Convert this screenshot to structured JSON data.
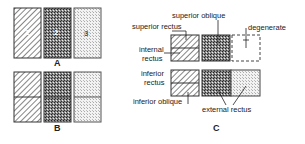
{
  "figure": {
    "panels": [
      {
        "id": "A",
        "label": "A",
        "boxes": [
          {
            "number": "1",
            "pattern": "hatched"
          },
          {
            "number": "2",
            "pattern": "dense-stipple"
          },
          {
            "number": "3",
            "pattern": "light-stipple"
          }
        ]
      },
      {
        "id": "B",
        "label": "B",
        "boxes": [
          {
            "pattern": "hatched",
            "split": "horizontal"
          },
          {
            "pattern": "dense-stipple",
            "split": "horizontal"
          },
          {
            "pattern": "light-stipple",
            "split": "horizontal"
          }
        ]
      },
      {
        "id": "C",
        "label": "C",
        "labels": {
          "superior_oblique": "superior oblique",
          "superior_rectus": "superior rectus",
          "internal_rectus_1": "internal",
          "internal_rectus_2": "rectus",
          "degenerate": "degenerate",
          "inferior_rectus_1": "inferior",
          "inferior_rectus_2": "rectus",
          "inferior_oblique": "inferior oblique",
          "external_rectus": "external rectus"
        }
      }
    ],
    "colors": {
      "stroke": "#333333",
      "hatch": "#444444",
      "dense": "#555555",
      "light": "#bbbbbb",
      "background": "#ffffff"
    }
  }
}
